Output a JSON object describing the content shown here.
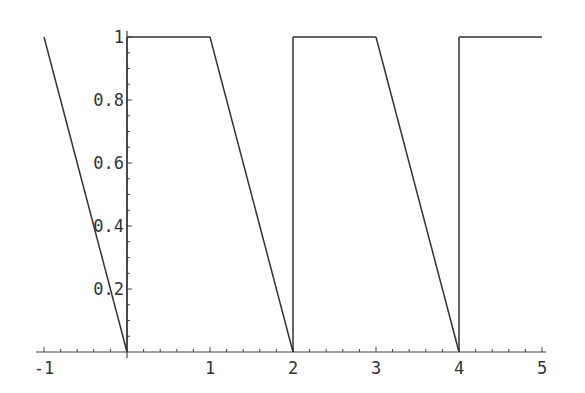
{
  "chart_data": {
    "type": "line",
    "title": "",
    "xlabel": "",
    "ylabel": "",
    "xlim": [
      -1.05,
      5.05
    ],
    "ylim": [
      0,
      1
    ],
    "grid": false,
    "legend": null,
    "x_ticks": [
      {
        "value": -1,
        "label": "-1"
      },
      {
        "value": 1,
        "label": "1"
      },
      {
        "value": 2,
        "label": "2"
      },
      {
        "value": 3,
        "label": "3"
      },
      {
        "value": 4,
        "label": "4"
      },
      {
        "value": 5,
        "label": "5"
      }
    ],
    "x_minor_step": 0.2,
    "y_ticks": [
      {
        "value": 0.2,
        "label": "0.2"
      },
      {
        "value": 0.4,
        "label": "0.4"
      },
      {
        "value": 0.6,
        "label": "0.6"
      },
      {
        "value": 0.8,
        "label": "0.8"
      },
      {
        "value": 1,
        "label": "1"
      }
    ],
    "y_minor_step": 0.05,
    "series": [
      {
        "name": "piecewise",
        "points": [
          [
            -1,
            1
          ],
          [
            0,
            0
          ],
          [
            0,
            1
          ],
          [
            1,
            1
          ],
          [
            2,
            0
          ],
          [
            2,
            1
          ],
          [
            3,
            1
          ],
          [
            4,
            0
          ],
          [
            4,
            1
          ],
          [
            5,
            1
          ]
        ]
      }
    ]
  }
}
